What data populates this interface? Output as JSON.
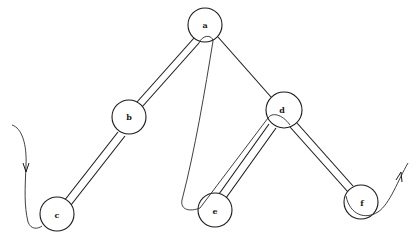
{
  "diagram": {
    "type": "tree-traversal",
    "nodes": [
      {
        "id": "a",
        "label": "a",
        "x": 205,
        "y": 25,
        "r": 17
      },
      {
        "id": "b",
        "label": "b",
        "x": 129,
        "y": 117,
        "r": 17
      },
      {
        "id": "c",
        "label": "c",
        "x": 57,
        "y": 214,
        "r": 17
      },
      {
        "id": "d",
        "label": "d",
        "x": 284,
        "y": 110,
        "r": 18
      },
      {
        "id": "e",
        "label": "e",
        "x": 215,
        "y": 210,
        "r": 17
      },
      {
        "id": "f",
        "label": "f",
        "x": 361,
        "y": 202,
        "r": 17
      }
    ],
    "edges": [
      {
        "from": "a",
        "to": "b",
        "style": "double"
      },
      {
        "from": "b",
        "to": "c",
        "style": "double"
      },
      {
        "from": "a",
        "to": "d",
        "style": "single"
      },
      {
        "from": "d",
        "to": "e",
        "style": "double"
      },
      {
        "from": "d",
        "to": "f",
        "style": "double"
      }
    ],
    "traversal": {
      "entry_arrow": "downward-arrow",
      "exit_arrow": "upward-arrow",
      "description": "Path enters from left, loops around c, climbs the a-b-c rail, wraps under a, descends to e, rides the d-e rail, wraps under d, descends d-f rail, loops under f, and exits upward right."
    }
  }
}
